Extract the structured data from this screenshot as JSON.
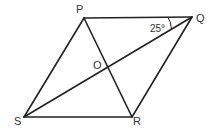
{
  "figure": {
    "type": "rhombus-with-diagonals",
    "vertices": {
      "P": {
        "label": "P",
        "x": 84,
        "y": 18
      },
      "Q": {
        "label": "Q",
        "x": 192,
        "y": 17
      },
      "R": {
        "label": "R",
        "x": 132,
        "y": 117
      },
      "S": {
        "label": "S",
        "x": 24,
        "y": 117
      }
    },
    "intersection": {
      "label": "O",
      "x": 108,
      "y": 67
    },
    "angle": {
      "at": "Q",
      "between": [
        "QP",
        "QS"
      ],
      "label": "25°"
    },
    "colors": {
      "stroke": "#222222",
      "text": "#333333",
      "background": "#ffffff"
    }
  }
}
